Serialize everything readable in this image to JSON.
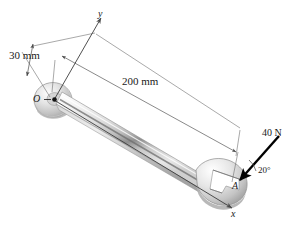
{
  "figure": {
    "background_color": "#ffffff",
    "line_color": "#4a4a4a",
    "force_color": "#000000",
    "metal_light": "#f2f2f2",
    "metal_mid": "#d4d4d4",
    "metal_dark": "#9a9a9a",
    "metal_edge": "#6b6b6b"
  },
  "dimensions": [
    {
      "id": "offset",
      "label": "30 mm",
      "value": 30,
      "unit": "mm",
      "description": "offset from O to dimension line"
    },
    {
      "id": "length",
      "label": "200 mm",
      "value": 200,
      "unit": "mm",
      "description": "handle length from O to A"
    }
  ],
  "axes": [
    {
      "id": "y-axis",
      "label": "y",
      "direction": "up-right from O"
    },
    {
      "id": "x-axis",
      "label": "x",
      "direction": "down-right through A"
    }
  ],
  "points": [
    {
      "id": "O",
      "label": "O",
      "description": "origin at closed/box jaw center"
    },
    {
      "id": "A",
      "label": "A",
      "description": "point of force application at open jaw"
    }
  ],
  "force": {
    "label": "40 N",
    "magnitude": 40,
    "unit": "N",
    "angle_label": "20°",
    "angle_value": 20,
    "applied_at": "A",
    "sense": "pointing down-left toward A"
  }
}
